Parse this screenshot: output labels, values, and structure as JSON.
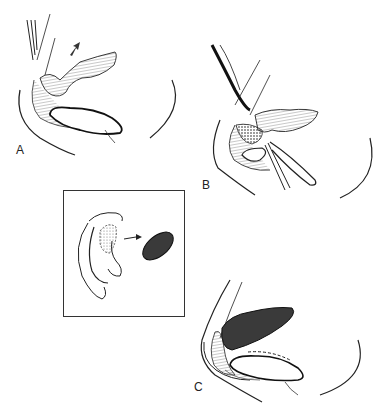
{
  "figure": {
    "panels": [
      {
        "id": "A",
        "label": "A",
        "description": "Cartilage exposure with retracted flap (arrow indicates direction)"
      },
      {
        "id": "B",
        "label": "B",
        "description": "Dissection with scissors beneath tissue flap"
      },
      {
        "id": "C",
        "label": "C",
        "description": "Cartilage graft placed into defect"
      }
    ],
    "inset": {
      "description": "Ear with conchal cartilage harvest site and excised graft",
      "arrow": "harvest-to-graft arrow"
    },
    "colors": {
      "line": "#222222",
      "hatch": "#888888",
      "graft": "#3a3a3a",
      "background": "#ffffff"
    }
  }
}
